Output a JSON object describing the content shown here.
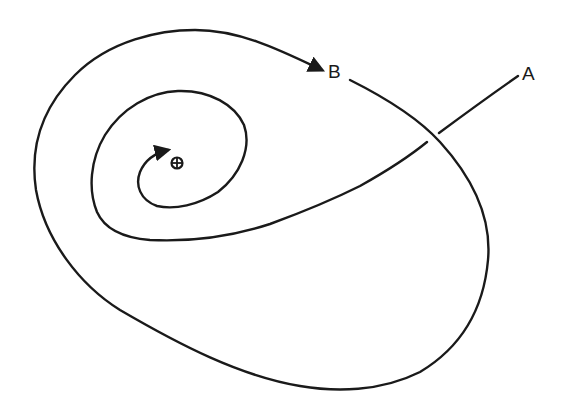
{
  "diagram": {
    "type": "spiral-trajectory",
    "labels": {
      "a": "A",
      "b": "B"
    },
    "target_symbol": "⊕",
    "colors": {
      "line": "#1a1a1a",
      "background": "#ffffff"
    }
  }
}
